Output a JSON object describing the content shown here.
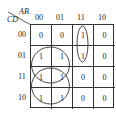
{
  "kmap": {
    "row_var": "CD",
    "col_var": "AB",
    "col_labels": [
      "00",
      "01",
      "11",
      "10"
    ],
    "row_labels": [
      "00",
      "01",
      "11",
      "10"
    ],
    "cells": [
      [
        "0",
        "0",
        "1",
        "0"
      ],
      [
        "1",
        "1",
        "1",
        "0"
      ],
      [
        "1",
        "1",
        "0",
        "0"
      ],
      [
        "1",
        "1",
        "0",
        "0"
      ]
    ],
    "groups": [
      {
        "name": "group-ab11-cd00-01",
        "shape": "ellipse"
      },
      {
        "name": "group-ab0x-cd01-11",
        "shape": "circle"
      },
      {
        "name": "group-ab0x-cd11-10",
        "shape": "circle"
      }
    ]
  }
}
